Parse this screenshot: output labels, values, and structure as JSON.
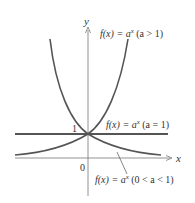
{
  "axes": {
    "x_label": "x",
    "y_label": "y",
    "origin_label": "0",
    "y_tick_label": "1"
  },
  "curves": {
    "growth": {
      "fn": "f(x) = a",
      "exp": "x",
      "cond": " (a > 1)"
    },
    "constant": {
      "fn": "f(x) = a",
      "exp": "x",
      "cond": " (a = 1)"
    },
    "decay": {
      "fn": "f(x) = a",
      "exp": "x",
      "cond": " (0 < a < 1)"
    }
  },
  "colors": {
    "curve": "#555555",
    "axis": "#777777",
    "text": "#333333"
  }
}
